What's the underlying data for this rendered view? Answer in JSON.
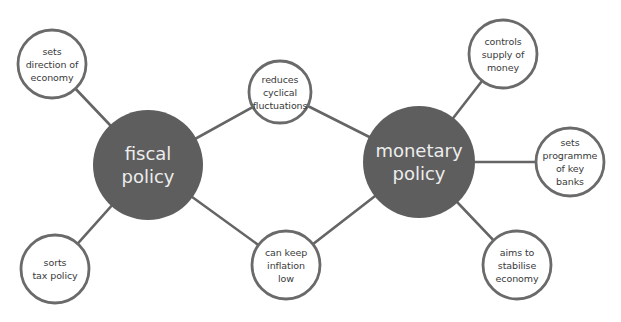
{
  "colors": {
    "hub_fill": "#5e5e5e",
    "hub_text": "#ededed",
    "leaf_fill": "#ffffff",
    "leaf_stroke": "#6a6a6a",
    "connector": "#656565",
    "leaf_text": "#3a3a3a"
  },
  "hubs": {
    "fiscal": {
      "label": "fiscal\npolicy",
      "cx": 148,
      "cy": 165,
      "r": 55
    },
    "monetary": {
      "label": "monetary\npolicy",
      "cx": 419,
      "cy": 162,
      "r": 56
    }
  },
  "nodes": {
    "sets_direction": {
      "label": "sets\ndirection of\neconomy",
      "cx": 52,
      "cy": 64,
      "r": 34
    },
    "sorts_tax": {
      "label": "sorts\ntax policy",
      "cx": 55,
      "cy": 269,
      "r": 34
    },
    "reduces_cyclical": {
      "label": "reduces\ncyclical\nfluctuations",
      "cx": 280,
      "cy": 92,
      "r": 31
    },
    "keep_inflation": {
      "label": "can keep\ninflation\nlow",
      "cx": 286,
      "cy": 265,
      "r": 34
    },
    "controls_supply": {
      "label": "controls\nsupply of\nmoney",
      "cx": 503,
      "cy": 54,
      "r": 34
    },
    "sets_programme": {
      "label": "sets\nprogramme\nof key\nbanks",
      "cx": 570,
      "cy": 162,
      "r": 34
    },
    "aims_stabilise": {
      "label": "aims to\nstabilise\neconomy",
      "cx": 517,
      "cy": 265,
      "r": 34
    }
  },
  "edges": [
    {
      "from": "fiscal",
      "to": "sets_direction"
    },
    {
      "from": "fiscal",
      "to": "sorts_tax"
    },
    {
      "from": "fiscal",
      "to": "reduces_cyclical"
    },
    {
      "from": "fiscal",
      "to": "keep_inflation"
    },
    {
      "from": "monetary",
      "to": "reduces_cyclical"
    },
    {
      "from": "monetary",
      "to": "keep_inflation"
    },
    {
      "from": "monetary",
      "to": "controls_supply"
    },
    {
      "from": "monetary",
      "to": "sets_programme"
    },
    {
      "from": "monetary",
      "to": "aims_stabilise"
    }
  ]
}
